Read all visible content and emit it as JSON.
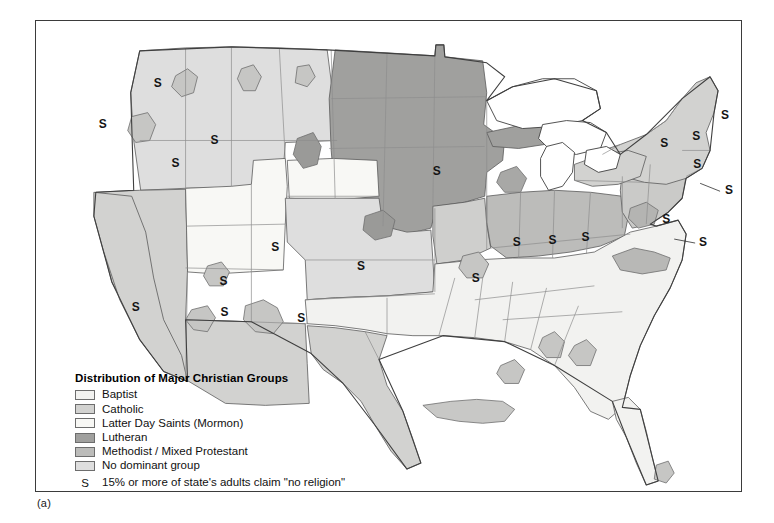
{
  "figure": {
    "caption": "(a)",
    "panel_label": "(a)"
  },
  "legend": {
    "title": "Distribution of Major Christian Groups",
    "items": [
      {
        "label": "Baptist",
        "key": "baptist",
        "color": "#f2f2f0"
      },
      {
        "label": "Catholic",
        "key": "catholic",
        "color": "#d2d2d0"
      },
      {
        "label": "Latter Day Saints (Mormon)",
        "key": "mormon",
        "color": "#f8f8f5"
      },
      {
        "label": "Lutheran",
        "key": "lutheran",
        "color": "#a0a09e"
      },
      {
        "label": "Methodist / Mixed Protestant",
        "key": "methodist",
        "color": "#bcbcba"
      },
      {
        "label": "No dominant group",
        "key": "none",
        "color": "#dedede"
      }
    ],
    "s_symbol": "S",
    "s_note": "15% or more of state's adults claim \"no religion\""
  },
  "map": {
    "title": "Distribution of Major Christian Groups",
    "region": "United States",
    "outline_color": "#4a4a4a",
    "frame_color": "#3b3b3b",
    "background": "#ffffff",
    "s_markers": [
      {
        "label": "S",
        "x": 122,
        "y": 66
      },
      {
        "label": "S",
        "x": 67,
        "y": 107
      },
      {
        "label": "S",
        "x": 179,
        "y": 124
      },
      {
        "label": "S",
        "x": 140,
        "y": 147
      },
      {
        "label": "S",
        "x": 402,
        "y": 155
      },
      {
        "label": "S",
        "x": 630,
        "y": 127
      },
      {
        "label": "S",
        "x": 662,
        "y": 120
      },
      {
        "label": "S",
        "x": 691,
        "y": 98
      },
      {
        "label": "S",
        "x": 663,
        "y": 148
      },
      {
        "label": "S",
        "x": 695,
        "y": 174
      },
      {
        "label": "S",
        "x": 240,
        "y": 231
      },
      {
        "label": "S",
        "x": 188,
        "y": 265
      },
      {
        "label": "S",
        "x": 326,
        "y": 250
      },
      {
        "label": "S",
        "x": 100,
        "y": 291
      },
      {
        "label": "S",
        "x": 189,
        "y": 296
      },
      {
        "label": "S",
        "x": 266,
        "y": 302
      },
      {
        "label": "S",
        "x": 441,
        "y": 262
      },
      {
        "label": "S",
        "x": 482,
        "y": 226
      },
      {
        "label": "S",
        "x": 518,
        "y": 224
      },
      {
        "label": "S",
        "x": 551,
        "y": 221
      },
      {
        "label": "S",
        "x": 632,
        "y": 203
      },
      {
        "label": "S",
        "x": 669,
        "y": 226
      }
    ],
    "leader_lines": [
      {
        "from_x": 686,
        "from_y": 172,
        "to_x": 664,
        "to_y": 164
      },
      {
        "from_x": 661,
        "from_y": 224,
        "to_x": 641,
        "to_y": 219
      }
    ]
  },
  "colors": {
    "baptist": "#f2f2f0",
    "catholic": "#d2d2d0",
    "mormon": "#f8f8f5",
    "lutheran": "#a0a09e",
    "methodist": "#bcbcba",
    "none": "#dedede",
    "water": "#ffffff",
    "stroke": "#4a4a4a",
    "text": "#111111"
  }
}
